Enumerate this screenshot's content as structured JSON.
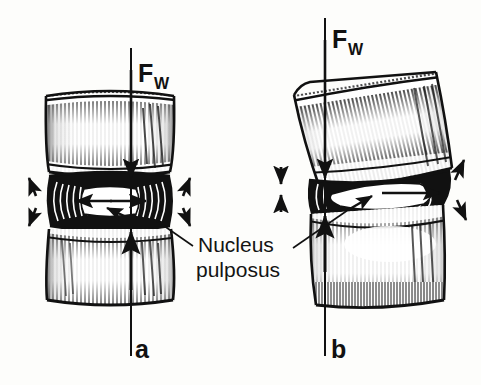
{
  "figure": {
    "background_color": "#fdfdfb",
    "ink_color": "#111111",
    "annotation": {
      "nucleus_label_line1": "Nucleus",
      "nucleus_label_line2": "pulposus",
      "name": "nucleus-pulposus"
    },
    "panels": [
      {
        "id": "a",
        "letter": "a",
        "condition": "symmetric-axial-load",
        "force_label_main": "F",
        "force_label_sub": "W",
        "force_direction": "downward",
        "disc_shape": "symmetric",
        "nucleus_shape": "centered-ellipse",
        "side_arrows": "bilateral-diagonal-outward"
      },
      {
        "id": "b",
        "letter": "b",
        "condition": "asymmetric-tilted-load",
        "force_label_main": "F",
        "force_label_sub": "W",
        "force_direction": "downward",
        "disc_shape": "wedged",
        "nucleus_shape": "displaced-ellipse",
        "side_arrows": "left-vertical-compression-right-diagonal"
      }
    ]
  }
}
